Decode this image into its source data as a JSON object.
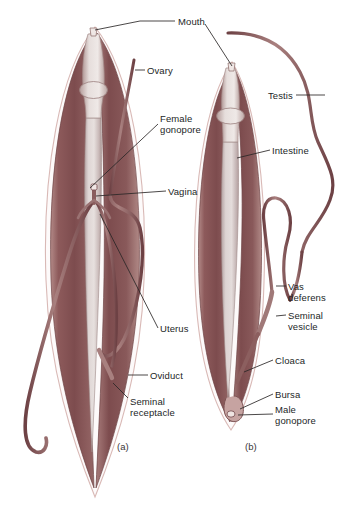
{
  "figure": {
    "background_color": "#ffffff",
    "panels": [
      {
        "id": "a",
        "caption": "(a)",
        "sex": "female",
        "caption_x": 117,
        "caption_y": 441
      },
      {
        "id": "b",
        "caption": "(b)",
        "sex": "male",
        "caption_x": 245,
        "caption_y": 441
      }
    ]
  },
  "palette": {
    "body_wall_dark": "#7d4c4e",
    "body_wall_mid": "#97696a",
    "body_wall_light": "#b98f8e",
    "intestine_pale": "#d9cfcf",
    "intestine_shade": "#bfaeae",
    "tube_outline": "#6e4244",
    "tube_fill": "#b08a8a",
    "cuticle_edge": "#e8d8d6",
    "leader_line": "#2b2727",
    "text": "#231f1f"
  },
  "labels": [
    {
      "name": "mouth",
      "text": "Mouth",
      "x": 178,
      "y": 16,
      "align": "left"
    },
    {
      "name": "ovary",
      "text": "Ovary",
      "x": 147,
      "y": 65,
      "align": "left"
    },
    {
      "name": "female-gonopore",
      "text": "Female\ngonopore",
      "x": 160,
      "y": 113,
      "align": "left"
    },
    {
      "name": "vagina",
      "text": "Vagina",
      "x": 168,
      "y": 186,
      "align": "left"
    },
    {
      "name": "uterus",
      "text": "Uterus",
      "x": 160,
      "y": 323,
      "align": "left"
    },
    {
      "name": "oviduct",
      "text": "Oviduct",
      "x": 150,
      "y": 370,
      "align": "left"
    },
    {
      "name": "seminal-receptacle",
      "text": "Seminal\nreceptacle",
      "x": 130,
      "y": 396,
      "align": "left"
    },
    {
      "name": "testis",
      "text": "Testis",
      "x": 268,
      "y": 90,
      "align": "left"
    },
    {
      "name": "intestine",
      "text": "Intestine",
      "x": 272,
      "y": 145,
      "align": "left"
    },
    {
      "name": "vas-deferens",
      "text": "Vas\ndeferens",
      "x": 288,
      "y": 281,
      "align": "left"
    },
    {
      "name": "seminal-vesicle",
      "text": "Seminal\nvesicle",
      "x": 288,
      "y": 310,
      "align": "left"
    },
    {
      "name": "cloaca",
      "text": "Cloaca",
      "x": 275,
      "y": 355,
      "align": "left"
    },
    {
      "name": "bursa",
      "text": "Bursa",
      "x": 275,
      "y": 389,
      "align": "left"
    },
    {
      "name": "male-gonopore",
      "text": "Male\ngonopore",
      "x": 275,
      "y": 404,
      "align": "left"
    }
  ],
  "leader_lines": [
    {
      "name": "leader-mouth-a",
      "points": "175,21 140,21 95,30"
    },
    {
      "name": "leader-mouth-b",
      "points": "205,24 232,66"
    },
    {
      "name": "leader-ovary",
      "points": "145,70 135,70"
    },
    {
      "name": "leader-female-gonopore",
      "points": "158,124 90,188"
    },
    {
      "name": "leader-vagina",
      "points": "166,191 96,196"
    },
    {
      "name": "leader-uterus",
      "points": "158,328 100,214"
    },
    {
      "name": "leader-oviduct",
      "points": "148,375 128,375"
    },
    {
      "name": "leader-seminal-receptacle",
      "points": "128,398 113,383"
    },
    {
      "name": "leader-testis",
      "points": "296,95 325,95"
    },
    {
      "name": "leader-intestine",
      "points": "270,150 237,158"
    },
    {
      "name": "leader-vas-deferens",
      "points": "286,286 276,286"
    },
    {
      "name": "leader-seminal-vesicle",
      "points": "286,315 276,316"
    },
    {
      "name": "leader-cloaca",
      "points": "273,360 244,372"
    },
    {
      "name": "leader-bursa",
      "points": "273,394 240,409"
    },
    {
      "name": "leader-male-gonopore",
      "points": "273,414 238,415"
    }
  ],
  "structures": {
    "female": {
      "body_outline_name": "female-body-outline",
      "organs": [
        "pharynx",
        "intestine",
        "ovary",
        "oviduct",
        "uterus",
        "vagina",
        "female-gonopore",
        "seminal-receptacle"
      ]
    },
    "male": {
      "body_outline_name": "male-body-outline",
      "organs": [
        "pharynx",
        "intestine",
        "testis",
        "vas-deferens",
        "seminal-vesicle",
        "cloaca",
        "bursa",
        "male-gonopore"
      ]
    }
  }
}
